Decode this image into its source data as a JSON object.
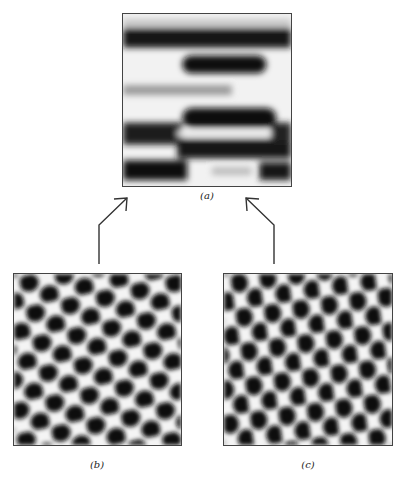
{
  "figure": {
    "panels": [
      {
        "id": "a",
        "label": "(a)",
        "pattern": "horizontal-stripes"
      },
      {
        "id": "b",
        "label": "(b)",
        "pattern": "hexagonal-spots"
      },
      {
        "id": "c",
        "label": "(c)",
        "pattern": "hexagonal-spots-rotated"
      }
    ],
    "arrows": [
      {
        "from": "b",
        "to": "a"
      },
      {
        "from": "c",
        "to": "a"
      }
    ]
  }
}
